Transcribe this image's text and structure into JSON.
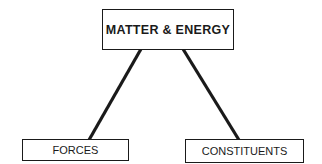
{
  "diagram": {
    "root": {
      "label": "MATTER & ENERGY"
    },
    "children": [
      {
        "label": "FORCES"
      },
      {
        "label": "CONSTITUENTS"
      }
    ],
    "edges": [
      {
        "from": "MATTER & ENERGY",
        "to": "FORCES"
      },
      {
        "from": "MATTER & ENERGY",
        "to": "CONSTITUENTS"
      }
    ],
    "colors": {
      "stroke": "#1a1a1a",
      "background": "#ffffff"
    }
  }
}
